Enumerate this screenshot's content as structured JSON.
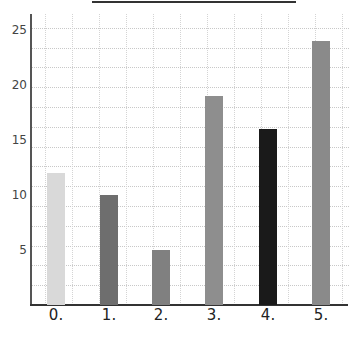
{
  "chart_data": {
    "type": "bar",
    "title": "",
    "xlabel": "",
    "ylabel": "",
    "categories": [
      "0.",
      "1.",
      "2.",
      "3.",
      "4.",
      "5."
    ],
    "values": [
      12,
      10,
      5,
      19,
      16,
      24
    ],
    "colors": [
      "#d9d9d9",
      "#6e6e6e",
      "#808080",
      "#8e8e8e",
      "#1a1a1a",
      "#8a8a8a"
    ],
    "yticks": [
      "5",
      "10",
      "15",
      "20",
      "25"
    ],
    "ylim": [
      0,
      26.5
    ],
    "grid": true,
    "legend": null
  }
}
